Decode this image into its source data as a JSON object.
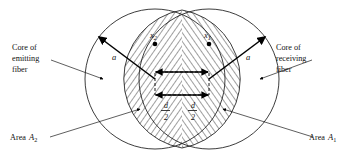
{
  "figure": {
    "type": "technical-diagram",
    "labels": {
      "left_core_line1": "Core of",
      "left_core_line2": "emitting",
      "left_core_line3": "fiber",
      "right_core_line1": "Core of",
      "right_core_line2": "receiving",
      "right_core_line3": "fiber",
      "area_left_text": "Area",
      "area_left_symbol": "A",
      "area_left_subscript": "2",
      "area_right_text": "Area",
      "area_right_symbol": "A",
      "area_right_subscript": "1",
      "radius_left": "a",
      "radius_right": "a",
      "point_left_symbol": "x",
      "point_left_subscript": "2",
      "point_right_symbol": "x",
      "point_right_subscript": "1",
      "offset_left_numerator": "d",
      "offset_left_denominator": "2",
      "offset_right_numerator": "d",
      "offset_right_denominator": "2"
    },
    "geometry": {
      "left_circle_center_x": 155,
      "left_circle_center_y": 79,
      "left_circle_radius": 70,
      "right_circle_center_x": 209,
      "right_circle_center_y": 79,
      "right_circle_radius": 70,
      "lens_top_x": 182,
      "lens_top_y": 10,
      "lens_bottom_x": 182,
      "lens_bottom_y": 148
    },
    "colors": {
      "line": "#1a1a1a",
      "hatch": "#000000",
      "background": "#ffffff",
      "text": "#111111"
    }
  }
}
